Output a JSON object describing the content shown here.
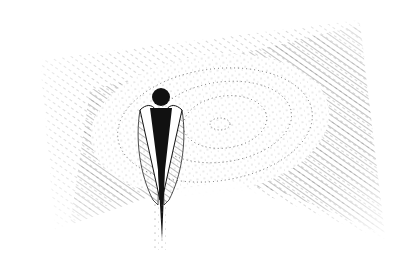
{
  "image": {
    "description": "Black-and-white stippled ink illustration: a dark angelic figure with a round head and folded wings stands before a large pale oval of concentric dotted rings, set against diagonally hatched shading, with a pale path leading down from the figure.",
    "subject": "angel-figure",
    "colors": {
      "ink": "#111111",
      "paper": "#ffffff",
      "stipple": "#555555"
    }
  }
}
